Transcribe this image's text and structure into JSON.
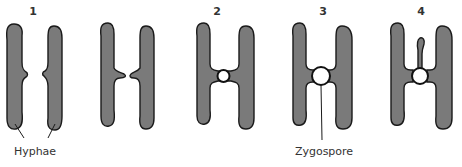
{
  "figure": {
    "colors": {
      "hypha_fill": "#7a7a7a",
      "outline": "#1a1a1a",
      "zygospore_fill": "#ffffff",
      "text": "#333333",
      "background": "#ffffff"
    },
    "stages": [
      {
        "label": "1",
        "description": "Hyphae with small side projections"
      },
      {
        "label": "",
        "description": "Projections growing toward each other"
      },
      {
        "label": "2",
        "description": "Projections meet; small zygospore forms"
      },
      {
        "label": "3",
        "description": "Zygospore enlarges"
      },
      {
        "label": "4",
        "description": "Zygospore with sporangium stalk growing upward"
      }
    ],
    "annotations": {
      "hyphae_label": "Hyphae",
      "zygospore_label": "Zygospore"
    }
  }
}
